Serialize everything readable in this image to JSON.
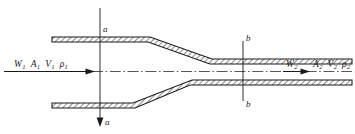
{
  "figure": {
    "type": "engineering-diagram"
  },
  "inlet": {
    "mass_flow": "W",
    "mass_flow_sub": "1",
    "area": "A",
    "area_sub": "1",
    "velocity": "V",
    "velocity_sub": "1",
    "density": "ρ",
    "density_sub": "1"
  },
  "outlet": {
    "mass_flow": "W",
    "mass_flow_sub": "2",
    "area": "A",
    "area_sub": "2",
    "velocity": "V",
    "velocity_sub": "2",
    "density": "ρ",
    "density_sub": "2"
  },
  "sections": {
    "upstream_top": "a",
    "upstream_bottom": "a",
    "downstream_top": "b",
    "downstream_bottom": "b"
  },
  "colors": {
    "stroke": "#1a1a1a",
    "hatch": "#2a2a2a",
    "wall_fill": "#ffffff",
    "centerline": "#3a3a3a",
    "background": "#ffffff"
  }
}
